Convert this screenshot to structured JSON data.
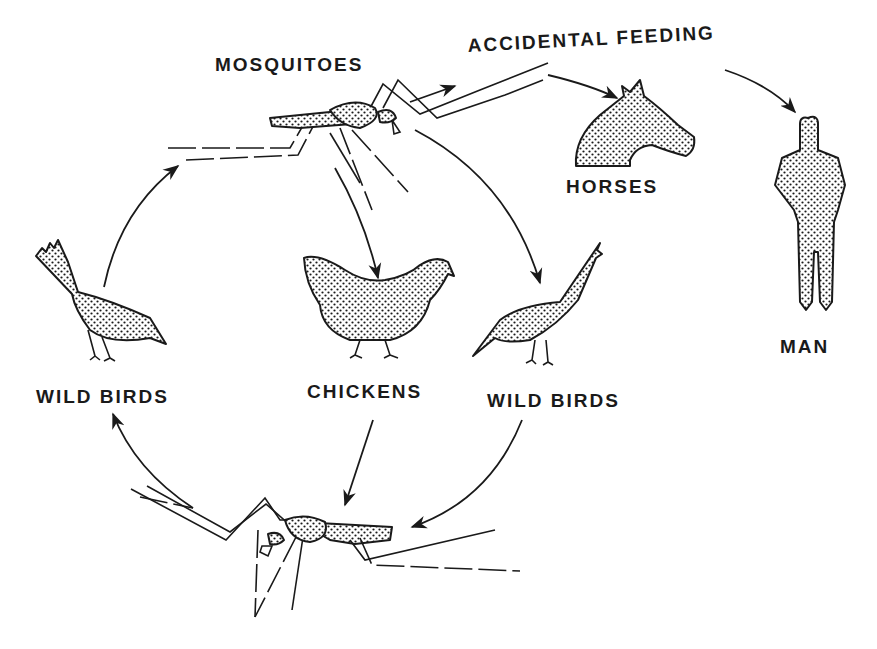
{
  "diagram": {
    "labels": {
      "mosquitoes": "MOSQUITOES",
      "accidental_feeding": "ACCIDENTAL FEEDING",
      "horses": "HORSES",
      "man": "MAN",
      "wild_birds_left": "WILD BIRDS",
      "chickens": "CHICKENS",
      "wild_birds_right": "WILD BIRDS"
    },
    "nodes": [
      {
        "id": "mosquito-top",
        "icon": "mosquito-icon",
        "label": "MOSQUITOES"
      },
      {
        "id": "horses",
        "icon": "horse-head-icon",
        "label": "HORSES"
      },
      {
        "id": "man",
        "icon": "human-figure-icon",
        "label": "MAN"
      },
      {
        "id": "wild-birds-left",
        "icon": "wild-bird-icon",
        "label": "WILD BIRDS"
      },
      {
        "id": "chickens",
        "icon": "chicken-icon",
        "label": "CHICKENS"
      },
      {
        "id": "wild-birds-right",
        "icon": "wild-bird-icon",
        "label": "WILD BIRDS"
      },
      {
        "id": "mosquito-bottom",
        "icon": "mosquito-icon",
        "label": ""
      }
    ],
    "edges": [
      {
        "from": "mosquito-top",
        "to": "accidental-feeding"
      },
      {
        "from": "accidental-feeding",
        "to": "horses"
      },
      {
        "from": "accidental-feeding",
        "to": "man"
      },
      {
        "from": "mosquito-top",
        "to": "chickens"
      },
      {
        "from": "mosquito-top",
        "to": "wild-birds-right"
      },
      {
        "from": "wild-birds-left",
        "to": "mosquito-top"
      },
      {
        "from": "chickens",
        "to": "mosquito-bottom"
      },
      {
        "from": "wild-birds-right",
        "to": "mosquito-bottom"
      },
      {
        "from": "mosquito-bottom",
        "to": "wild-birds-left"
      }
    ],
    "colors": {
      "ink": "#1a1a1a",
      "background": "#ffffff"
    }
  }
}
